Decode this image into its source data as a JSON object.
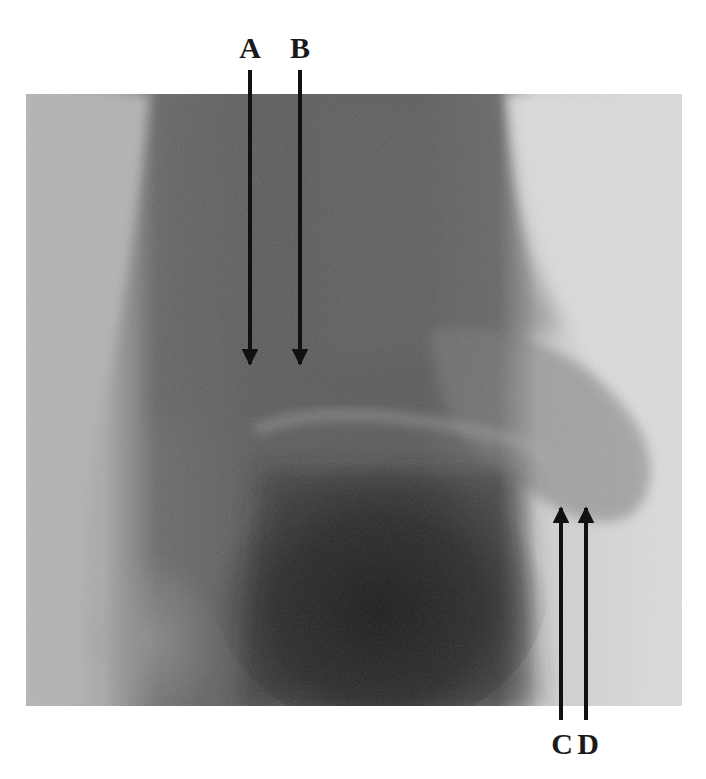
{
  "figure": {
    "background_color": "#ffffff",
    "arrow_color": "#111111",
    "label_color": "#1a1a1a",
    "annotations": [
      {
        "id": "A",
        "label": "A",
        "direction": "down"
      },
      {
        "id": "B",
        "label": "B",
        "direction": "down"
      },
      {
        "id": "C",
        "label": "C",
        "direction": "up"
      },
      {
        "id": "D",
        "label": "D",
        "direction": "up"
      }
    ]
  }
}
